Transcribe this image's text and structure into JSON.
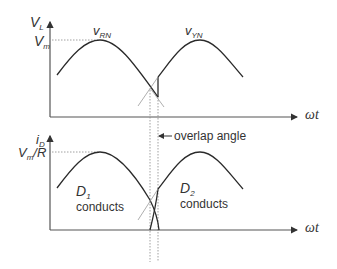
{
  "top_plot": {
    "y_label": "V",
    "y_label_sub": "L",
    "peak_label": "V",
    "peak_label_sub": "m",
    "x_label": "ωt",
    "curve1_label": "v",
    "curve1_sub": "RN",
    "curve2_label": "v",
    "curve2_sub": "YN"
  },
  "bottom_plot": {
    "y_label": "i",
    "y_label_sub": "D",
    "peak_label_a": "V",
    "peak_label_sub": "m",
    "peak_label_b": "/R",
    "x_label": "ωt",
    "diode1_label": "D",
    "diode1_sub": "1",
    "diode1_text": "conducts",
    "diode2_label": "D",
    "diode2_sub": "2",
    "diode2_text": "conducts"
  },
  "annotation": {
    "overlap_label": "overlap angle"
  },
  "colors": {
    "curve": "#2a2a2a",
    "axis": "#555555",
    "guide": "#888888",
    "text": "#333333"
  }
}
